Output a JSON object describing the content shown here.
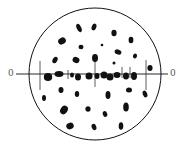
{
  "diagram": {
    "type": "diffraction-pattern",
    "colors": {
      "ink": "#111111",
      "label": "#555555",
      "background": "#ffffff"
    },
    "circle": {
      "cx": 95,
      "cy": 74,
      "r": 66
    },
    "axis": {
      "y": 74,
      "x1": 16,
      "x2": 168,
      "left_label": "0",
      "right_label": "0"
    },
    "ticks": [
      {
        "x": 40,
        "y1": 61,
        "y2": 90
      },
      {
        "x": 68,
        "y1": 70,
        "y2": 79
      },
      {
        "x": 95,
        "y1": 56,
        "y2": 87
      },
      {
        "x": 122,
        "y1": 67,
        "y2": 78
      },
      {
        "x": 130,
        "y1": 67,
        "y2": 78
      },
      {
        "x": 146,
        "y1": 60,
        "y2": 90
      }
    ],
    "spots": [
      {
        "cx": 79,
        "cy": 28,
        "rx": 2.2,
        "ry": 4.5,
        "rot": -25
      },
      {
        "cx": 94,
        "cy": 27,
        "rx": 2.3,
        "ry": 3.5,
        "rot": 20
      },
      {
        "cx": 62,
        "cy": 41,
        "rx": 4,
        "ry": 3.3,
        "rot": -30
      },
      {
        "cx": 81,
        "cy": 47,
        "rx": 2.5,
        "ry": 2.3,
        "rot": 0
      },
      {
        "cx": 102,
        "cy": 45,
        "rx": 1.3,
        "ry": 1.3,
        "rot": 0
      },
      {
        "cx": 114,
        "cy": 33,
        "rx": 2.6,
        "ry": 3.2,
        "rot": 0
      },
      {
        "cx": 131,
        "cy": 40,
        "rx": 2.4,
        "ry": 3.3,
        "rot": 0
      },
      {
        "cx": 118,
        "cy": 52,
        "rx": 3.5,
        "ry": 2.5,
        "rot": 20
      },
      {
        "cx": 135,
        "cy": 56,
        "rx": 2,
        "ry": 2.5,
        "rot": 20
      },
      {
        "cx": 55,
        "cy": 60,
        "rx": 2.3,
        "ry": 3.5,
        "rot": 30
      },
      {
        "cx": 76,
        "cy": 60,
        "rx": 3.5,
        "ry": 3,
        "rot": 20
      },
      {
        "cx": 95,
        "cy": 58,
        "rx": 3,
        "ry": 4,
        "rot": 0
      },
      {
        "cx": 114,
        "cy": 63,
        "rx": 1.5,
        "ry": 1.5,
        "rot": 0
      },
      {
        "cx": 150,
        "cy": 68,
        "rx": 2.6,
        "ry": 3,
        "rot": 0
      },
      {
        "cx": 48,
        "cy": 77,
        "rx": 4.2,
        "ry": 4,
        "rot": 0
      },
      {
        "cx": 59,
        "cy": 74,
        "rx": 4.5,
        "ry": 3,
        "rot": 0
      },
      {
        "cx": 72,
        "cy": 75,
        "rx": 2,
        "ry": 2.5,
        "rot": 0
      },
      {
        "cx": 78,
        "cy": 77,
        "rx": 3,
        "ry": 3.5,
        "rot": 0
      },
      {
        "cx": 89,
        "cy": 76,
        "rx": 3.5,
        "ry": 3.5,
        "rot": 0
      },
      {
        "cx": 97,
        "cy": 76,
        "rx": 2.5,
        "ry": 3,
        "rot": 0
      },
      {
        "cx": 104,
        "cy": 75,
        "rx": 3.5,
        "ry": 3.5,
        "rot": 0
      },
      {
        "cx": 110,
        "cy": 77,
        "rx": 3.5,
        "ry": 3.5,
        "rot": 0
      },
      {
        "cx": 117,
        "cy": 75,
        "rx": 3.5,
        "ry": 3,
        "rot": 0
      },
      {
        "cx": 126,
        "cy": 76,
        "rx": 3,
        "ry": 3.5,
        "rot": 0
      },
      {
        "cx": 134,
        "cy": 76,
        "rx": 3,
        "ry": 4,
        "rot": 0
      },
      {
        "cx": 61,
        "cy": 90,
        "rx": 2.5,
        "ry": 3,
        "rot": 0
      },
      {
        "cx": 77,
        "cy": 94,
        "rx": 2.2,
        "ry": 3,
        "rot": 0
      },
      {
        "cx": 108,
        "cy": 95,
        "rx": 2.5,
        "ry": 4,
        "rot": 0
      },
      {
        "cx": 129,
        "cy": 90,
        "rx": 3,
        "ry": 2.5,
        "rot": 0
      },
      {
        "cx": 145,
        "cy": 94,
        "rx": 2.2,
        "ry": 3.5,
        "rot": -20
      },
      {
        "cx": 44,
        "cy": 98,
        "rx": 2,
        "ry": 3,
        "rot": 0
      },
      {
        "cx": 64,
        "cy": 110,
        "rx": 3.5,
        "ry": 4.5,
        "rot": 35
      },
      {
        "cx": 88,
        "cy": 109,
        "rx": 2.6,
        "ry": 2.8,
        "rot": 0
      },
      {
        "cx": 105,
        "cy": 114,
        "rx": 2.2,
        "ry": 3,
        "rot": -20
      },
      {
        "cx": 126,
        "cy": 107,
        "rx": 2.8,
        "ry": 4.5,
        "rot": 0
      },
      {
        "cx": 70,
        "cy": 126,
        "rx": 3.8,
        "ry": 3.2,
        "rot": -20
      },
      {
        "cx": 94,
        "cy": 127,
        "rx": 2.3,
        "ry": 3.3,
        "rot": -20
      },
      {
        "cx": 121,
        "cy": 126,
        "rx": 2.3,
        "ry": 3.8,
        "rot": 0
      }
    ]
  }
}
